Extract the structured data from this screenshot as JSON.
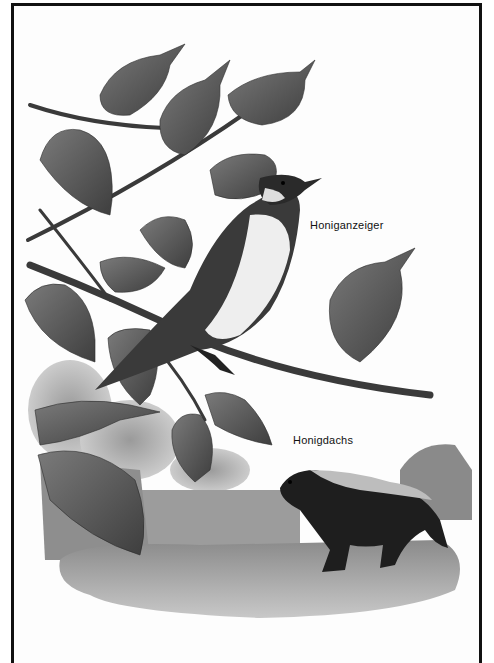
{
  "illustration": {
    "style": "grayscale natural history illustration",
    "subjects": [
      {
        "id": "bird",
        "caption": "Honiganzeiger"
      },
      {
        "id": "badger",
        "caption": "Honigdachs"
      }
    ]
  },
  "colors": {
    "frame": "#111111",
    "leaf_dark": "#4a4a4a",
    "leaf_mid": "#6a6a6a",
    "ground": "#9a9a9a",
    "badger": "#1e1e1e",
    "paper": "#fdfdfd"
  }
}
